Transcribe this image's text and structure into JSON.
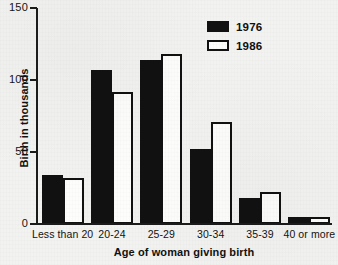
{
  "chart_data": {
    "type": "bar",
    "title": "",
    "xlabel": "Age of woman giving birth",
    "ylabel": "Birth in thousands",
    "categories": [
      "Less than 20",
      "20-24",
      "25-29",
      "30-34",
      "35-39",
      "40 or more"
    ],
    "series": [
      {
        "name": "1976",
        "values": [
          34,
          107,
          114,
          52,
          18,
          5
        ],
        "color": "#111111",
        "style": "filled"
      },
      {
        "name": "1986",
        "values": [
          32,
          92,
          118,
          71,
          22,
          5
        ],
        "color": "#fdfdfb",
        "style": "hollow-black-outline"
      }
    ],
    "ylim": [
      0,
      150
    ],
    "yticks": [
      0,
      50,
      100,
      150
    ],
    "ytick_labels": [
      "0",
      "50",
      "100",
      "150"
    ],
    "grid": false,
    "legend_position": "top-right",
    "legend_entries": [
      "1976",
      "1986"
    ]
  },
  "figure": {
    "background_color": "#f2f2f0",
    "axis_color": "#1b1b1b"
  }
}
